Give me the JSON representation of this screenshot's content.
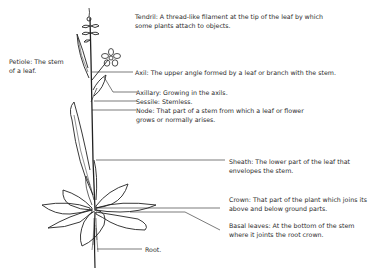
{
  "diagram": {
    "labels": {
      "tendril": {
        "line1": "Tendril: A thread-like filament at the tip of the leaf by which",
        "line2": "some plants attach to objects."
      },
      "petiole": {
        "line1": "Petiole: The stem",
        "line2": "of a leaf."
      },
      "axil": {
        "line1": "Axil: The upper angle formed by a leaf or branch with the stem."
      },
      "axillary": {
        "line1": "Axillary: Growing in the axils."
      },
      "sessile": {
        "line1": "Sessile:  Stemless."
      },
      "node": {
        "line1": "Node: That part of a stem from which a leaf or flower",
        "line2": "grows or normally arises."
      },
      "sheath": {
        "line1": "Sheath: The lower part of the leaf that",
        "line2": "envelopes the stem."
      },
      "crown": {
        "line1": "Crown: That part of the plant which joins its",
        "line2": "above and below ground parts."
      },
      "basal": {
        "line1": "Basal leaves: At the bottom of the stem",
        "line2": "where it joints the root crown."
      },
      "root": {
        "line1": "Root."
      }
    }
  }
}
